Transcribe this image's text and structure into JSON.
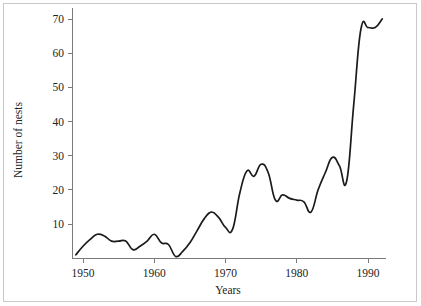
{
  "chart_data": {
    "type": "line",
    "title": "",
    "subtitle": "",
    "xlabel": "Years",
    "ylabel": "Number of nests",
    "xlim": [
      1948.5,
      1992.5
    ],
    "ylim": [
      0,
      72
    ],
    "xticks": [
      1950,
      1960,
      1970,
      1980,
      1990
    ],
    "xtick_labels": [
      "1950",
      "1960",
      "1970",
      "1980",
      "1990"
    ],
    "yticks": [
      10,
      20,
      30,
      40,
      50,
      60,
      70
    ],
    "ytick_labels": [
      "10",
      "20",
      "30",
      "40",
      "50",
      "60",
      "70"
    ],
    "grid": false,
    "legend": false,
    "legend_position": "none",
    "line_color": "#1b1b1b",
    "axis_color": "#7a7a7a",
    "background_color": "#ffffff",
    "x": [
      1949,
      1950,
      1951,
      1952,
      1953,
      1954,
      1955,
      1956,
      1957,
      1958,
      1959,
      1960,
      1961,
      1962,
      1963,
      1964,
      1965,
      1966,
      1967,
      1968,
      1969,
      1970,
      1971,
      1972,
      1973,
      1974,
      1975,
      1976,
      1977,
      1978,
      1979,
      1980,
      1981,
      1982,
      1983,
      1984,
      1985,
      1986,
      1987,
      1988,
      1989,
      1990,
      1991,
      1992
    ],
    "values": [
      1.0,
      3.5,
      5.5,
      7.0,
      6.5,
      5.0,
      5.0,
      5.0,
      2.5,
      3.5,
      5.0,
      7.0,
      4.5,
      4.0,
      0.5,
      2.0,
      4.5,
      8.0,
      11.5,
      13.5,
      12.0,
      9.0,
      8.5,
      19.0,
      25.5,
      24.0,
      27.5,
      25.0,
      17.0,
      18.5,
      17.5,
      17.0,
      16.5,
      13.5,
      20.0,
      25.0,
      29.5,
      27.0,
      22.5,
      45.0,
      67.0,
      67.5,
      67.5,
      70.0
    ],
    "series": [
      {
        "name": "Number of nests",
        "values": [
          1.0,
          3.5,
          5.5,
          7.0,
          6.5,
          5.0,
          5.0,
          5.0,
          2.5,
          3.5,
          5.0,
          7.0,
          4.5,
          4.0,
          0.5,
          2.0,
          4.5,
          8.0,
          11.5,
          13.5,
          12.0,
          9.0,
          8.5,
          19.0,
          25.5,
          24.0,
          27.5,
          25.0,
          17.0,
          18.5,
          17.5,
          17.0,
          16.5,
          13.5,
          20.0,
          25.0,
          29.5,
          27.0,
          22.5,
          45.0,
          67.0,
          67.5,
          67.5,
          70.0
        ]
      }
    ]
  }
}
